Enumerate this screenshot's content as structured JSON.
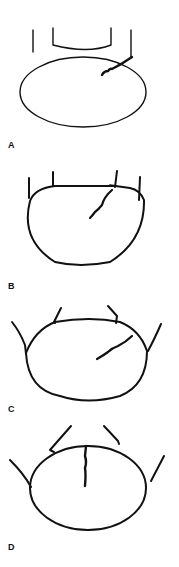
{
  "figure": {
    "panels": [
      {
        "label": "A",
        "label_pos": [
          8,
          146
        ]
      },
      {
        "label": "B",
        "label_pos": [
          8,
          287
        ]
      },
      {
        "label": "C",
        "label_pos": [
          8,
          409
        ]
      },
      {
        "label": "D",
        "label_pos": [
          8,
          548
        ]
      }
    ],
    "colors": {
      "stroke": "#111111",
      "background": "#ffffff"
    }
  }
}
